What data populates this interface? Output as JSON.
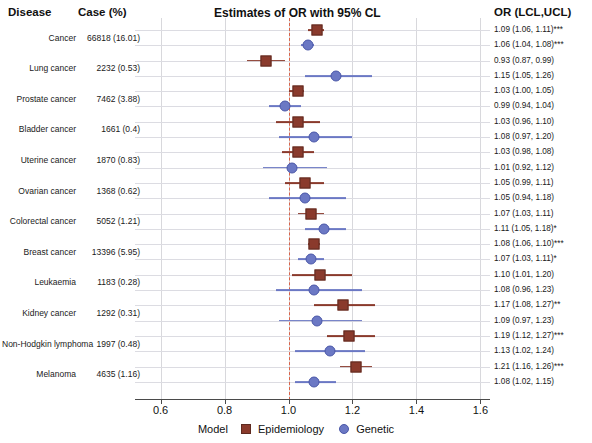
{
  "header": {
    "disease": "Disease",
    "case": "Case (%)",
    "title": "Estimates of OR with 95% CL",
    "or": "OR (LCL,UCL)"
  },
  "legend": {
    "label": "Model",
    "epidemiology": "Epidemiology",
    "genetic": "Genetic"
  },
  "colors": {
    "epidemiology": "#8a3a2c",
    "genetic": "#6b78c4",
    "reference_line": "#d9644a",
    "grid": "#d8d8dc"
  },
  "chart_data": {
    "type": "scatter",
    "title": "Estimates of OR with 95% CL",
    "xlabel": "",
    "ylabel": "",
    "xlim": [
      0.52,
      1.63
    ],
    "xticks": [
      "0.6",
      "0.8",
      "1.0",
      "1.2",
      "1.4",
      "1.6"
    ],
    "xtick_values": [
      0.6,
      0.8,
      1.0,
      1.2,
      1.4,
      1.6
    ],
    "reference_line_x": 1.0,
    "grid": true,
    "legend_position": "bottom",
    "series": [
      {
        "name": "Epidemiology",
        "marker": "square",
        "color": "#8a3a2c"
      },
      {
        "name": "Genetic",
        "marker": "circle",
        "color": "#6b78c4"
      }
    ],
    "rows": [
      {
        "disease": "Cancer",
        "case": "66818 (16.01)",
        "epi": {
          "or": 1.09,
          "lcl": 1.06,
          "ucl": 1.11,
          "stars": "***",
          "text": "1.09 (1.06, 1.11)"
        },
        "gen": {
          "or": 1.06,
          "lcl": 1.04,
          "ucl": 1.08,
          "stars": "***",
          "text": "1.06 (1.04, 1.08)"
        }
      },
      {
        "disease": "Lung cancer",
        "case": "2232 (0.53)",
        "epi": {
          "or": 0.93,
          "lcl": 0.87,
          "ucl": 0.99,
          "stars": "",
          "text": "0.93 (0.87, 0.99)"
        },
        "gen": {
          "or": 1.15,
          "lcl": 1.05,
          "ucl": 1.26,
          "stars": "",
          "text": "1.15 (1.05, 1.26)"
        }
      },
      {
        "disease": "Prostate cancer",
        "case": "7462 (3.88)",
        "epi": {
          "or": 1.03,
          "lcl": 1.0,
          "ucl": 1.05,
          "stars": "",
          "text": "1.03 (1.00, 1.05)"
        },
        "gen": {
          "or": 0.99,
          "lcl": 0.94,
          "ucl": 1.04,
          "stars": "",
          "text": "0.99 (0.94, 1.04)"
        }
      },
      {
        "disease": "Bladder cancer",
        "case": "1661 (0.4)",
        "epi": {
          "or": 1.03,
          "lcl": 0.96,
          "ucl": 1.1,
          "stars": "",
          "text": "1.03 (0.96, 1.10)"
        },
        "gen": {
          "or": 1.08,
          "lcl": 0.97,
          "ucl": 1.2,
          "stars": "",
          "text": "1.08 (0.97, 1.20)"
        }
      },
      {
        "disease": "Uterine cancer",
        "case": "1870 (0.83)",
        "epi": {
          "or": 1.03,
          "lcl": 0.98,
          "ucl": 1.08,
          "stars": "",
          "text": "1.03 (0.98, 1.08)"
        },
        "gen": {
          "or": 1.01,
          "lcl": 0.92,
          "ucl": 1.12,
          "stars": "",
          "text": "1.01 (0.92, 1.12)"
        }
      },
      {
        "disease": "Ovarian cancer",
        "case": "1368 (0.62)",
        "epi": {
          "or": 1.05,
          "lcl": 0.99,
          "ucl": 1.11,
          "stars": "",
          "text": "1.05 (0.99, 1.11)"
        },
        "gen": {
          "or": 1.05,
          "lcl": 0.94,
          "ucl": 1.18,
          "stars": "",
          "text": "1.05 (0.94, 1.18)"
        }
      },
      {
        "disease": "Colorectal cancer",
        "case": "5052 (1.21)",
        "epi": {
          "or": 1.07,
          "lcl": 1.03,
          "ucl": 1.11,
          "stars": "",
          "text": "1.07 (1.03, 1.11)"
        },
        "gen": {
          "or": 1.11,
          "lcl": 1.05,
          "ucl": 1.18,
          "stars": "*",
          "text": "1.11 (1.05, 1.18)"
        }
      },
      {
        "disease": "Breast cancer",
        "case": "13396 (5.95)",
        "epi": {
          "or": 1.08,
          "lcl": 1.06,
          "ucl": 1.1,
          "stars": "***",
          "text": "1.08 (1.06, 1.10)"
        },
        "gen": {
          "or": 1.07,
          "lcl": 1.03,
          "ucl": 1.11,
          "stars": "*",
          "text": "1.07 (1.03, 1.11)"
        }
      },
      {
        "disease": "Leukaemia",
        "case": "1183 (0.28)",
        "epi": {
          "or": 1.1,
          "lcl": 1.01,
          "ucl": 1.2,
          "stars": "",
          "text": "1.10 (1.01, 1.20)"
        },
        "gen": {
          "or": 1.08,
          "lcl": 0.96,
          "ucl": 1.23,
          "stars": "",
          "text": "1.08 (0.96, 1.23)"
        }
      },
      {
        "disease": "Kidney cancer",
        "case": "1292 (0.31)",
        "epi": {
          "or": 1.17,
          "lcl": 1.08,
          "ucl": 1.27,
          "stars": "**",
          "text": "1.17 (1.08, 1.27)"
        },
        "gen": {
          "or": 1.09,
          "lcl": 0.97,
          "ucl": 1.23,
          "stars": "",
          "text": "1.09 (0.97, 1.23)"
        }
      },
      {
        "disease": "Non-Hodgkin lymphoma",
        "case": "1997 (0.48)",
        "epi": {
          "or": 1.19,
          "lcl": 1.12,
          "ucl": 1.27,
          "stars": "***",
          "text": "1.19 (1.12, 1.27)"
        },
        "gen": {
          "or": 1.13,
          "lcl": 1.02,
          "ucl": 1.24,
          "stars": "",
          "text": "1.13 (1.02, 1.24)"
        }
      },
      {
        "disease": "Melanoma",
        "case": "4635 (1.16)",
        "epi": {
          "or": 1.21,
          "lcl": 1.16,
          "ucl": 1.26,
          "stars": "***",
          "text": "1.21 (1.16, 1.26)"
        },
        "gen": {
          "or": 1.08,
          "lcl": 1.02,
          "ucl": 1.15,
          "stars": "",
          "text": "1.08 (1.02, 1.15)"
        }
      }
    ]
  }
}
